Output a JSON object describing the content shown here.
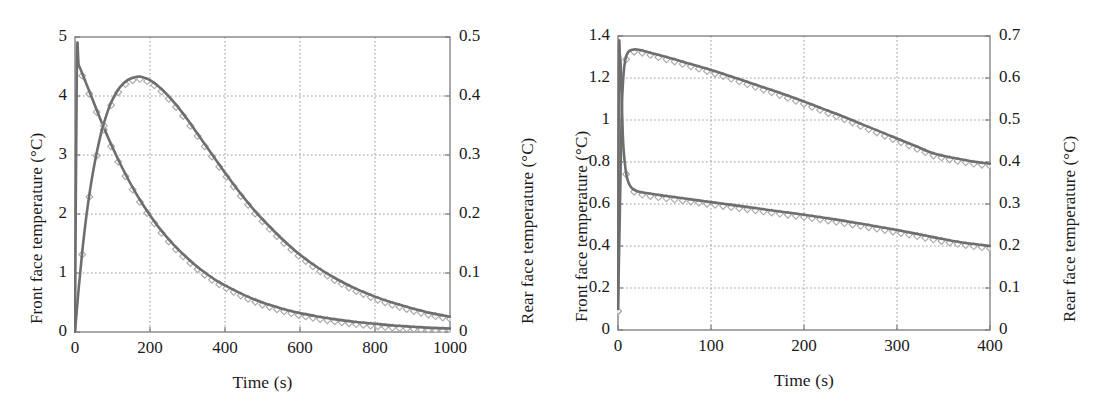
{
  "figure": {
    "background_color": "#ffffff",
    "line_color": "#6e6e6e",
    "marker_edge_color": "#a8a8a8",
    "axis_color": "#7a7a7a",
    "grid_color": "#9a9a9a",
    "text_color": "#1a1a1a"
  },
  "panels": [
    {
      "id": "left",
      "xlabel": "Time (s)",
      "ylabel_left": "Front face temperature (°C)",
      "ylabel_right": "Rear face temperature (°C)",
      "xlim": [
        0,
        1000
      ],
      "ylim_left": [
        0,
        5
      ],
      "ylim_right": [
        0,
        0.5
      ],
      "xticks": [
        0,
        200,
        400,
        600,
        800,
        1000
      ],
      "xticklabels": [
        "0",
        "200",
        "400",
        "600",
        "800",
        "1000"
      ],
      "yticks_left": [
        0,
        1,
        2,
        3,
        4,
        5
      ],
      "yticklabels_left": [
        "0",
        "1",
        "2",
        "3",
        "4",
        "5"
      ],
      "yticks_right": [
        0,
        0.1,
        0.2,
        0.3,
        0.4,
        0.5
      ],
      "yticklabels_right": [
        "0",
        "0.1",
        "0.2",
        "0.3",
        "0.4",
        "0.5"
      ],
      "grid": true
    },
    {
      "id": "right",
      "xlabel": "Time (s)",
      "ylabel_left": "Front face temperature (°C)",
      "ylabel_right": "Rear face temperature (°C)",
      "xlim": [
        0,
        400
      ],
      "ylim_left": [
        0,
        1.4
      ],
      "ylim_right": [
        0,
        0.7
      ],
      "xticks": [
        0,
        100,
        200,
        300,
        400
      ],
      "xticklabels": [
        "0",
        "100",
        "200",
        "300",
        "400"
      ],
      "yticks_left": [
        0,
        0.2,
        0.4,
        0.6,
        0.8,
        1,
        1.2,
        1.4
      ],
      "yticklabels_left": [
        "0",
        "0.2",
        "0.4",
        "0.6",
        "0.8",
        "1",
        "1.2",
        "1.4"
      ],
      "yticks_right": [
        0,
        0.1,
        0.2,
        0.3,
        0.4,
        0.5,
        0.6,
        0.7
      ],
      "yticklabels_right": [
        "0",
        "0.1",
        "0.2",
        "0.3",
        "0.4",
        "0.5",
        "0.6",
        "0.7"
      ],
      "grid": true
    }
  ],
  "chart_data": [
    {
      "type": "line",
      "panel": "left",
      "title": "",
      "xlabel": "Time (s)",
      "ylabel": "Front face temperature (°C)",
      "ylabel_secondary": "Rear face temperature (°C)",
      "xlim": [
        0,
        1000
      ],
      "ylim": [
        0,
        5
      ],
      "ylim_secondary": [
        0,
        0.5
      ],
      "grid": true,
      "legend": "none",
      "series": [
        {
          "name": "Front face temperature (model)",
          "axis": "left",
          "style": "solid-line-with-open-diamond-markers",
          "x": [
            0,
            5,
            10,
            20,
            30,
            40,
            50,
            60,
            70,
            80,
            90,
            100,
            120,
            140,
            160,
            180,
            200,
            225,
            250,
            275,
            300,
            325,
            350,
            375,
            400,
            450,
            500,
            550,
            600,
            650,
            700,
            750,
            800,
            850,
            900,
            950,
            1000
          ],
          "y": [
            0,
            4.58,
            4.52,
            4.37,
            4.21,
            4.05,
            3.89,
            3.73,
            3.57,
            3.42,
            3.27,
            3.13,
            2.86,
            2.61,
            2.38,
            2.17,
            1.98,
            1.76,
            1.57,
            1.4,
            1.25,
            1.11,
            0.99,
            0.88,
            0.79,
            0.63,
            0.5,
            0.4,
            0.32,
            0.26,
            0.21,
            0.17,
            0.14,
            0.11,
            0.09,
            0.07,
            0.06
          ]
        },
        {
          "name": "Rear face temperature (model)",
          "axis": "right",
          "style": "solid-line-with-open-diamond-markers",
          "x": [
            0,
            10,
            20,
            30,
            40,
            50,
            60,
            70,
            80,
            90,
            100,
            120,
            140,
            160,
            170,
            180,
            200,
            220,
            240,
            260,
            280,
            300,
            330,
            360,
            400,
            440,
            480,
            520,
            560,
            600,
            650,
            700,
            750,
            800,
            850,
            900,
            950,
            1000
          ],
          "y": [
            0,
            0.075,
            0.14,
            0.195,
            0.24,
            0.278,
            0.31,
            0.338,
            0.36,
            0.379,
            0.394,
            0.415,
            0.427,
            0.432,
            0.433,
            0.432,
            0.427,
            0.418,
            0.406,
            0.392,
            0.377,
            0.36,
            0.333,
            0.306,
            0.27,
            0.236,
            0.205,
            0.178,
            0.153,
            0.131,
            0.108,
            0.089,
            0.073,
            0.06,
            0.049,
            0.04,
            0.032,
            0.026
          ]
        }
      ]
    },
    {
      "type": "line",
      "panel": "right",
      "title": "",
      "xlabel": "Time (s)",
      "ylabel": "Front face temperature (°C)",
      "ylabel_secondary": "Rear face temperature (°C)",
      "xlim": [
        0,
        400
      ],
      "ylim": [
        0,
        1.4
      ],
      "ylim_secondary": [
        0,
        0.7
      ],
      "grid": true,
      "legend": "none",
      "series": [
        {
          "name": "Front face temperature (model)",
          "axis": "left",
          "style": "solid-line-with-open-diamond-markers",
          "x": [
            0,
            1,
            2,
            3,
            4,
            5,
            6,
            8,
            10,
            12,
            15,
            20,
            25,
            30,
            40,
            50,
            60,
            70,
            80,
            90,
            100,
            120,
            140,
            160,
            180,
            200,
            220,
            240,
            260,
            280,
            300,
            320,
            340,
            360,
            380,
            400
          ],
          "y": [
            0.1,
            1.28,
            1.31,
            1.25,
            1.1,
            0.95,
            0.86,
            0.77,
            0.72,
            0.695,
            0.675,
            0.662,
            0.656,
            0.652,
            0.645,
            0.639,
            0.633,
            0.627,
            0.621,
            0.615,
            0.609,
            0.597,
            0.585,
            0.573,
            0.561,
            0.549,
            0.536,
            0.522,
            0.507,
            0.492,
            0.476,
            0.459,
            0.441,
            0.424,
            0.411,
            0.4
          ]
        },
        {
          "name": "Rear face temperature (model)",
          "axis": "right",
          "style": "solid-line-with-open-diamond-markers",
          "x": [
            0,
            2,
            4,
            6,
            8,
            10,
            12,
            15,
            18,
            20,
            25,
            30,
            40,
            50,
            60,
            80,
            100,
            120,
            140,
            160,
            180,
            200,
            220,
            240,
            260,
            280,
            300,
            320,
            340,
            360,
            380,
            400
          ],
          "y": [
            0.05,
            0.28,
            0.52,
            0.61,
            0.645,
            0.658,
            0.664,
            0.667,
            0.668,
            0.668,
            0.666,
            0.663,
            0.657,
            0.651,
            0.645,
            0.632,
            0.619,
            0.605,
            0.59,
            0.575,
            0.56,
            0.544,
            0.527,
            0.51,
            0.492,
            0.474,
            0.456,
            0.438,
            0.42,
            0.41,
            0.402,
            0.396
          ]
        }
      ]
    }
  ]
}
